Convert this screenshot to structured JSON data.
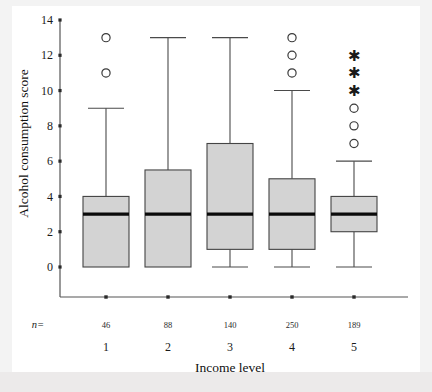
{
  "chart_data": {
    "type": "boxplot",
    "title": "",
    "xlabel": "Income level",
    "ylabel": "Alcohol consumption score",
    "ylim": [
      0,
      14
    ],
    "y_ticks": [
      0,
      2,
      4,
      6,
      8,
      10,
      12,
      14
    ],
    "y_tick_labels": [
      "0",
      "2",
      "4",
      "6",
      "8",
      "10",
      "12",
      "14"
    ],
    "grid": false,
    "legend": "none",
    "n_prefix": "n=",
    "categories": [
      "1",
      "2",
      "3",
      "4",
      "5"
    ],
    "counts": [
      "46",
      "88",
      "140",
      "250",
      "189"
    ],
    "boxes": [
      {
        "category": "1",
        "n": "46",
        "whisker_low": 0,
        "q1": 0,
        "median": 3,
        "q3": 4,
        "whisker_high": 9,
        "outliers": [
          11,
          13
        ],
        "extremes": []
      },
      {
        "category": "2",
        "n": "88",
        "whisker_low": 0,
        "q1": 0,
        "median": 3,
        "q3": 5.5,
        "whisker_high": 13,
        "outliers": [],
        "extremes": []
      },
      {
        "category": "3",
        "n": "140",
        "whisker_low": 0,
        "q1": 1,
        "median": 3,
        "q3": 7,
        "whisker_high": 13,
        "outliers": [],
        "extremes": []
      },
      {
        "category": "4",
        "n": "250",
        "whisker_low": 0,
        "q1": 1,
        "median": 3,
        "q3": 5,
        "whisker_high": 10,
        "outliers": [
          11,
          12,
          13
        ],
        "extremes": []
      },
      {
        "category": "5",
        "n": "189",
        "whisker_low": 0,
        "q1": 2,
        "median": 3,
        "q3": 4,
        "whisker_high": 6,
        "outliers": [
          7,
          8,
          9
        ],
        "extremes": [
          10,
          11,
          12
        ]
      }
    ],
    "colors": {
      "box_fill": "#d3d3d3",
      "box_stroke": "#444444",
      "median": "#0a0a0a",
      "whisker": "#4a4a4a",
      "outlier": "#3a3a3a",
      "axis": "#555555",
      "background": "#ffffff",
      "page": "#f3f3f3"
    }
  }
}
